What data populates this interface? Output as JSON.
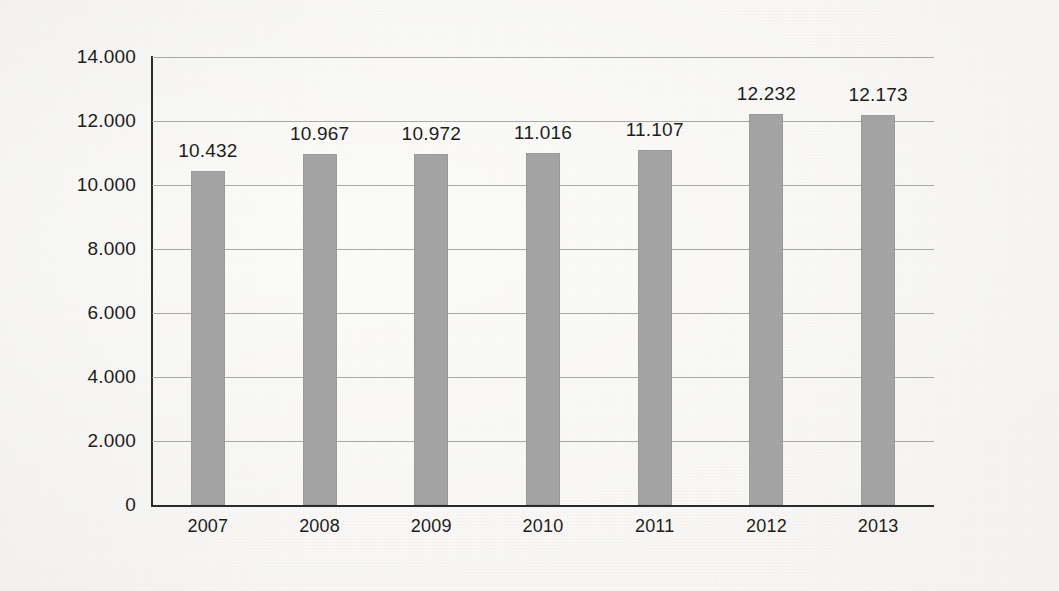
{
  "chart_data": {
    "type": "bar",
    "title": "",
    "subtitle": "",
    "xlabel": "",
    "ylabel": "",
    "categories": [
      "2007",
      "2008",
      "2009",
      "2010",
      "2011",
      "2012",
      "2013"
    ],
    "values": [
      10432,
      10967,
      10972,
      11016,
      11107,
      12232,
      12173
    ],
    "value_labels": [
      "10.432",
      "10.967",
      "10.972",
      "11.016",
      "11.107",
      "12.232",
      "12.173"
    ],
    "ylim": [
      0,
      14000
    ],
    "ytick_values": [
      0,
      2000,
      4000,
      6000,
      8000,
      10000,
      12000,
      14000
    ],
    "ytick_labels": [
      "0",
      "2.000",
      "4.000",
      "6.000",
      "8.000",
      "10.000",
      "12.000",
      "14.000"
    ],
    "grid": true,
    "legend": false,
    "legend_position": "none",
    "bar_color": "#a3a3a3",
    "bar_edge_color": "#9a9a9a",
    "axis_color": "#2b2b2b",
    "gridline_color": "#9a9a96",
    "text_color": "#1d1d1b",
    "background_color": "#f8f7f5",
    "thousands_separator": "."
  }
}
